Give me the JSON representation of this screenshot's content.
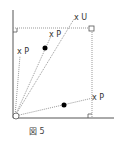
{
  "figure": {
    "caption": "図 5",
    "labels": {
      "u": "x U",
      "p_upper": "x P",
      "p_left": "x P",
      "p_right": "x P"
    }
  },
  "colors": {
    "axis": "#555555",
    "dotted": "#999999",
    "point": "#000000"
  }
}
